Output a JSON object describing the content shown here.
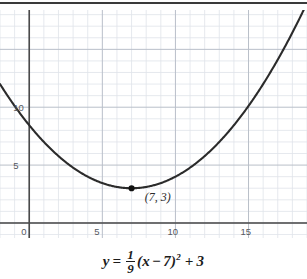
{
  "figure": {
    "title_rule": "",
    "equation": {
      "lhs": "y",
      "equals": "=",
      "fraction_numerator": "1",
      "fraction_denominator": "9",
      "open_paren": "(",
      "variable": "x",
      "minus": "−",
      "shift": "7",
      "close_paren": ")",
      "exponent": "2",
      "plus": "+",
      "constant": "3",
      "full_text": "y = 1/9 (x − 7)² + 3"
    }
  },
  "chart_data": {
    "type": "line",
    "title": "",
    "subtitle": "",
    "xlabel": "",
    "ylabel": "",
    "function": "y = (1/9)(x - 7)^2 + 3",
    "coefficient_a": 0.1111111111,
    "vertex": {
      "x": 7,
      "y": 3,
      "label": "(7, 3)"
    },
    "xlim": [
      -2,
      19
    ],
    "ylim": [
      -1.3,
      18.4
    ],
    "x_ticks": [
      0,
      5,
      10,
      15
    ],
    "x_tick_labels": [
      "0",
      "5",
      "10",
      "15"
    ],
    "y_ticks": [
      5,
      10
    ],
    "y_tick_labels": [
      "5",
      "10"
    ],
    "grid": true,
    "minor_grid_step": 1,
    "major_grid_step": 5,
    "legend": "none",
    "series": [
      {
        "name": "parabola",
        "points_x": [
          -2,
          -1,
          0,
          1,
          2,
          3,
          4,
          5,
          6,
          7,
          8,
          9,
          10,
          11,
          12,
          13,
          14,
          15,
          16,
          17,
          18,
          19
        ],
        "points_y": [
          12.0,
          10.11,
          8.44,
          7.0,
          5.78,
          4.78,
          4.0,
          3.44,
          3.11,
          3.0,
          3.11,
          3.44,
          4.0,
          4.78,
          5.78,
          7.0,
          8.44,
          10.11,
          12.0,
          14.11,
          16.44,
          19.0
        ]
      }
    ],
    "annotations": [
      {
        "name": "vertex-point",
        "x": 7,
        "y": 3,
        "marker": "filled-circle"
      },
      {
        "name": "vertex-label",
        "text": "(7, 3)",
        "x": 7.9,
        "y": 1.9
      }
    ],
    "colors": {
      "curve": "#2b2b2b",
      "axis": "#4a4a4a",
      "minor_grid": "#dfe3ea",
      "major_grid": "#b9bfc9",
      "tick_label": "#55595f",
      "vertex_marker": "#111111",
      "background": "#ffffff"
    }
  }
}
